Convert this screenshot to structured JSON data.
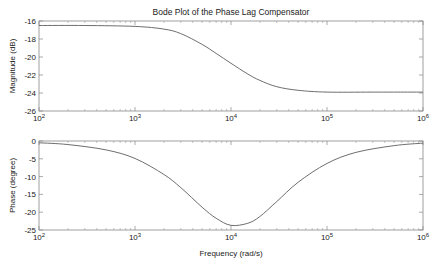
{
  "chart_data": [
    {
      "type": "line",
      "title": "Bode Plot of the Phase Lag Compensator",
      "xlabel": "",
      "ylabel": "Magnitude (dB)",
      "xscale": "log",
      "xlim": [
        100,
        1000000
      ],
      "ylim": [
        -26,
        -16
      ],
      "xticks": [
        100,
        1000,
        10000,
        100000,
        1000000
      ],
      "xtick_labels": [
        [
          "10",
          "2"
        ],
        [
          "10",
          "3"
        ],
        [
          "10",
          "4"
        ],
        [
          "10",
          "5"
        ],
        [
          "10",
          "6"
        ]
      ],
      "yticks": [
        -16,
        -18,
        -20,
        -22,
        -24,
        -26
      ],
      "ytick_labels": [
        "-16",
        "-18",
        "-20",
        "-22",
        "-24",
        "-26"
      ],
      "grid": false,
      "series": [
        {
          "name": "magnitude",
          "x": [
            100,
            300,
            1000,
            2000,
            3000,
            5000,
            7000,
            10000,
            15000,
            20000,
            30000,
            50000,
            100000,
            300000,
            1000000
          ],
          "y": [
            -16.5,
            -16.5,
            -16.6,
            -16.9,
            -17.4,
            -18.6,
            -19.6,
            -20.7,
            -21.9,
            -22.6,
            -23.3,
            -23.7,
            -23.9,
            -23.9,
            -23.9
          ]
        }
      ]
    },
    {
      "type": "line",
      "title": "",
      "xlabel": "Frequency (rad/s)",
      "ylabel": "Phase (degree)",
      "xscale": "log",
      "xlim": [
        100,
        1000000
      ],
      "ylim": [
        -25,
        0
      ],
      "xticks": [
        100,
        1000,
        10000,
        100000,
        1000000
      ],
      "xtick_labels": [
        [
          "10",
          "2"
        ],
        [
          "10",
          "3"
        ],
        [
          "10",
          "4"
        ],
        [
          "10",
          "5"
        ],
        [
          "10",
          "6"
        ]
      ],
      "yticks": [
        0,
        -5,
        -10,
        -15,
        -20,
        -25
      ],
      "ytick_labels": [
        "0",
        "-5",
        "-10",
        "-15",
        "-20",
        "-25"
      ],
      "grid": false,
      "series": [
        {
          "name": "phase",
          "x": [
            100,
            200,
            500,
            1000,
            2000,
            3000,
            5000,
            7000,
            10000,
            15000,
            20000,
            30000,
            50000,
            100000,
            200000,
            500000,
            1000000
          ],
          "y": [
            -0.5,
            -1.0,
            -2.5,
            -4.9,
            -9.4,
            -13.1,
            -18.6,
            -21.7,
            -23.7,
            -23.1,
            -21.2,
            -17.0,
            -11.6,
            -6.3,
            -3.2,
            -1.3,
            -0.6
          ]
        }
      ]
    }
  ]
}
